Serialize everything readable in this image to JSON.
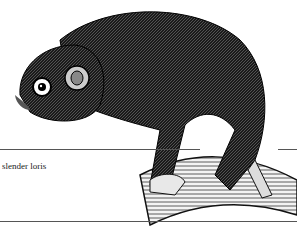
{
  "figure": {
    "label": "slender loris",
    "colors": {
      "ink": "#111111",
      "paper": "#ffffff",
      "rule": "#555555"
    }
  }
}
